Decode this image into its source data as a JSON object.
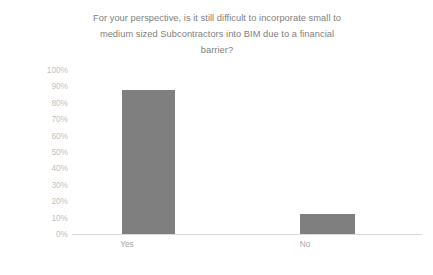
{
  "chart_data": {
    "type": "bar",
    "title": "For your perspective, is it still difficult to incorporate small to medium sized Subcontractors into BIM due to a financial barrier?",
    "title_lines": [
      "For your perspective, is it still difficult to incorporate small to",
      "medium sized Subcontractors into BIM due to a financial",
      "barrier?"
    ],
    "categories": [
      "Yes",
      "No"
    ],
    "values": [
      88,
      12
    ],
    "value_labels": [
      "88%",
      "12%"
    ],
    "xlabel": "",
    "ylabel": "",
    "ylim": [
      0,
      100
    ],
    "ytick_step": 10,
    "ytick_labels": [
      "100%",
      "90%",
      "80%",
      "70%",
      "60%",
      "50%",
      "40%",
      "30%",
      "20%",
      "10%",
      "0%"
    ],
    "ytick_values": [
      100,
      90,
      80,
      70,
      60,
      50,
      40,
      30,
      20,
      10,
      0
    ],
    "grid": false,
    "legend": false,
    "series": [
      {
        "name": "Responses",
        "values": [
          88,
          12
        ]
      }
    ],
    "colors": {
      "bar": "#7f7f7f",
      "title_text": "#808080",
      "ytick_text": "#bfbfbf",
      "xtick_text": "#a6a6a6",
      "axis_line": "#d9d9d9",
      "background": "#ffffff"
    }
  }
}
